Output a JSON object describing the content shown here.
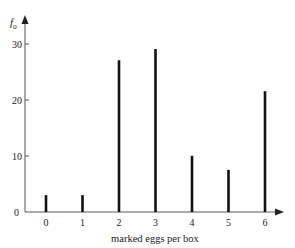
{
  "chart_data": {
    "type": "bar",
    "title": "",
    "xlabel": "marked eggs per box",
    "ylabel": "f_o",
    "ylabel_main": "f",
    "ylabel_sub": "o",
    "categories": [
      "0",
      "1",
      "2",
      "3",
      "4",
      "5",
      "6"
    ],
    "values": [
      3,
      3,
      27,
      29,
      10,
      7.5,
      21.5
    ],
    "yticks": [
      0,
      10,
      20,
      30
    ],
    "ylim": [
      0,
      34
    ],
    "grid": false,
    "legend": null,
    "style": "spike / line bars"
  },
  "axes": {
    "y_tick_labels": [
      "0",
      "10",
      "20",
      "30"
    ],
    "x_tick_labels": [
      "0",
      "1",
      "2",
      "3",
      "4",
      "5",
      "6"
    ]
  }
}
